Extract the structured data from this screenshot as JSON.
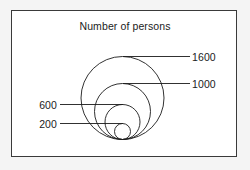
{
  "chart": {
    "title": "Number of persons",
    "geometry": {
      "center_x": 122.5,
      "baseline_y": 139.5
    }
  },
  "chart_data": {
    "type": "bubble",
    "title": "Number of persons",
    "subtitle": "",
    "xlabel": "",
    "ylabel": "",
    "encoding": "nested circles tangent at a common bottom baseline; circle size encodes the number of persons",
    "grid": false,
    "legend": "inline leader-line labels",
    "categories": [
      "1600",
      "1000",
      "600",
      "200"
    ],
    "values": [
      1600,
      1000,
      600,
      200
    ],
    "series": [
      {
        "name": "Number of persons",
        "values": [
          1600,
          1000,
          600,
          200
        ]
      }
    ],
    "circles": [
      {
        "label": "1600",
        "value": 1600,
        "radius_px": 41.5,
        "center_x": 122.5,
        "center_y": 98.0,
        "top_y": 56.5,
        "label_side": "right",
        "leader_y": 56.5
      },
      {
        "label": "1000",
        "value": 1000,
        "radius_px": 28.0,
        "center_x": 122.5,
        "center_y": 111.5,
        "top_y": 83.5,
        "label_side": "right",
        "leader_y": 83.5
      },
      {
        "label": "600",
        "value": 600,
        "radius_px": 17.5,
        "center_x": 122.5,
        "center_y": 122.0,
        "top_y": 104.5,
        "label_side": "left",
        "leader_y": 104.5
      },
      {
        "label": "200",
        "value": 200,
        "radius_px": 8.0,
        "center_x": 122.5,
        "center_y": 131.5,
        "top_y": 123.5,
        "label_side": "left",
        "leader_y": 123.5
      }
    ],
    "annotations": [
      {
        "text": "1600",
        "side": "right",
        "x": 192,
        "y": 56.5
      },
      {
        "text": "1000",
        "side": "right",
        "x": 192,
        "y": 83.5
      },
      {
        "text": "600",
        "side": "left",
        "x": 56,
        "y": 104.5
      },
      {
        "text": "200",
        "side": "left",
        "x": 56,
        "y": 123.5
      }
    ]
  },
  "labels": {
    "v1600": "1600",
    "v1000": "1000",
    "v600": "600",
    "v200": "200"
  },
  "colors": {
    "stroke": "#1b1b1b",
    "frame": "#3a3a3a",
    "plot_background": "#ffffff",
    "page_background": "#f4f4f4",
    "text": "#1b1b1b"
  }
}
